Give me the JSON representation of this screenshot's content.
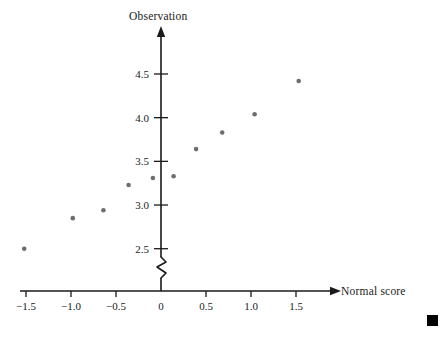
{
  "chart_data": {
    "type": "scatter",
    "title": "",
    "xlabel": "Normal score",
    "ylabel": "Observation",
    "x": [
      -1.52,
      -0.98,
      -0.64,
      -0.36,
      -0.09,
      0.14,
      0.39,
      0.68,
      1.04,
      1.53
    ],
    "y": [
      2.5,
      2.85,
      2.94,
      3.23,
      3.31,
      3.33,
      3.64,
      3.83,
      4.04,
      4.42
    ],
    "points": [
      {
        "x": -1.52,
        "y": 2.5
      },
      {
        "x": -0.98,
        "y": 2.85
      },
      {
        "x": -0.64,
        "y": 2.94
      },
      {
        "x": -0.36,
        "y": 3.23
      },
      {
        "x": -0.09,
        "y": 3.31
      },
      {
        "x": 0.14,
        "y": 3.33
      },
      {
        "x": 0.39,
        "y": 3.64
      },
      {
        "x": 0.68,
        "y": 3.83
      },
      {
        "x": 1.04,
        "y": 4.04
      },
      {
        "x": 1.53,
        "y": 4.42
      }
    ],
    "xticks": [
      -1.5,
      -1.0,
      -0.5,
      0,
      0.5,
      1.0,
      1.5
    ],
    "xticklabels": [
      "−1.5",
      "−1.0",
      "−0.5",
      "0",
      "0.5",
      "1.0",
      "1.5"
    ],
    "yticks": [
      2.5,
      3.0,
      3.5,
      4.0,
      4.5
    ],
    "yticklabels": [
      "2.5",
      "3.0",
      "3.5",
      "4.0",
      "4.5"
    ],
    "xlim": [
      -1.8,
      2.2
    ],
    "ylim": [
      2.25,
      4.75
    ],
    "grid": false,
    "legend": null,
    "y_axis_break": true,
    "marker_color": "#6e6e6e",
    "axis_color": "#1a1a1a",
    "background": "#ffffff"
  },
  "labels": {
    "y_axis_title": "Observation",
    "x_axis_title": "Normal score"
  },
  "marks": {
    "corner_square": ""
  }
}
